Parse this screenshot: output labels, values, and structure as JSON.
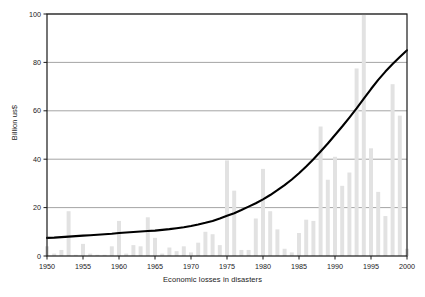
{
  "chart_data": {
    "type": "bar",
    "title": "",
    "subtitle": "",
    "xlabel": "Economic losses in disasters",
    "ylabel": "Billion us$",
    "xlim": [
      1950,
      2000
    ],
    "ylim": [
      0,
      100
    ],
    "ytick_values": [
      0,
      20,
      40,
      60,
      80,
      100
    ],
    "ytick_labels": [
      "0",
      "20",
      "40",
      "60",
      "80",
      "100"
    ],
    "xtick_values": [
      1950,
      1955,
      1960,
      1965,
      1970,
      1975,
      1980,
      1985,
      1990,
      1995,
      2000
    ],
    "xtick_labels": [
      "1950",
      "1955",
      "1960",
      "1965",
      "1970",
      "1975",
      "1980",
      "1985",
      "1990",
      "1995",
      "2000"
    ],
    "grid": "horizontal",
    "legend": "none",
    "bar_color": "#e2e2e2",
    "line_color": "#000000",
    "axis_color": "#1a1a1a",
    "gridline_color": "#9a9a9a",
    "categories": [
      1950,
      1951,
      1952,
      1953,
      1954,
      1955,
      1956,
      1957,
      1958,
      1959,
      1960,
      1961,
      1962,
      1963,
      1964,
      1965,
      1966,
      1967,
      1968,
      1969,
      1970,
      1971,
      1972,
      1973,
      1974,
      1975,
      1976,
      1977,
      1978,
      1979,
      1980,
      1981,
      1982,
      1983,
      1984,
      1985,
      1986,
      1987,
      1988,
      1989,
      1990,
      1991,
      1992,
      1993,
      1994,
      1995,
      1996,
      1997,
      1998,
      1999,
      2000
    ],
    "series": [
      {
        "name": "Annual economic losses",
        "type": "bar",
        "values": [
          4.0,
          1.0,
          2.5,
          18.5,
          0.5,
          5.0,
          1.0,
          0.5,
          0.5,
          4.0,
          14.5,
          1.0,
          4.5,
          4.0,
          16.0,
          7.5,
          1.0,
          3.5,
          2.0,
          4.0,
          1.5,
          5.5,
          10.0,
          9.0,
          4.5,
          39.5,
          27.0,
          2.5,
          2.5,
          15.5,
          36.0,
          18.5,
          11.0,
          3.0,
          1.5,
          9.5,
          15.0,
          14.5,
          53.5,
          31.5,
          41.0,
          29.0,
          34.5,
          77.5,
          100.0,
          44.5,
          26.5,
          16.5,
          71.0,
          58.0,
          3.0
        ]
      },
      {
        "name": "Trend (smoothed)",
        "type": "line",
        "values": [
          7.5,
          7.6,
          7.8,
          8.0,
          8.2,
          8.4,
          8.6,
          8.8,
          9.0,
          9.2,
          9.5,
          9.7,
          9.9,
          10.1,
          10.3,
          10.5,
          10.8,
          11.1,
          11.5,
          11.9,
          12.4,
          13.0,
          13.7,
          14.5,
          15.5,
          16.6,
          17.7,
          19.0,
          20.4,
          21.8,
          23.4,
          25.2,
          27.2,
          29.3,
          31.6,
          34.2,
          37.0,
          40.0,
          43.2,
          46.5,
          50.0,
          53.5,
          57.2,
          61.0,
          65.0,
          69.0,
          72.8,
          76.2,
          79.3,
          82.2,
          85.0
        ]
      }
    ]
  },
  "figure": {
    "alt_description": "Line and bar chart of economic losses in disasters 1950-2000"
  }
}
